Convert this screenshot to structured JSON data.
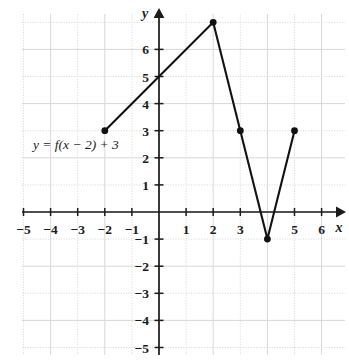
{
  "figure": {
    "kind": "cartesian-graph",
    "background_color": "#ffffff",
    "grid_color": "#d8d8d8",
    "axis_color": "#1b1b1b",
    "curve_color": "#111111"
  },
  "annotation": {
    "equation_label": "y = f(x − 2) + 3"
  },
  "axes": {
    "x_axis_name": "x",
    "y_axis_name": "y",
    "x_tick_labels": [
      "−5",
      "−4",
      "−3",
      "−2",
      "−1",
      "1",
      "2",
      "3",
      "5",
      "6"
    ],
    "x_tick_values": [
      -5,
      -4,
      -3,
      -2,
      -1,
      1,
      2,
      3,
      5,
      6
    ],
    "y_tick_labels": [
      "6",
      "5",
      "4",
      "3",
      "2",
      "1",
      "−1",
      "−2",
      "−3",
      "−4",
      "−5"
    ],
    "y_tick_values": [
      6,
      5,
      4,
      3,
      2,
      1,
      -1,
      -2,
      -3,
      -4,
      -5
    ]
  },
  "chart_data": {
    "type": "line",
    "title": "",
    "subtitle": "",
    "xlabel": "x",
    "ylabel": "y",
    "xlim": [
      -5.05,
      6.85
    ],
    "ylim": [
      -5.2,
      7.3
    ],
    "grid": true,
    "grid_step": 1,
    "legend": false,
    "legend_position": "none",
    "annotations": [
      {
        "text": "y = f(x − 2) + 3",
        "x": -3.7,
        "y": 2.55
      }
    ],
    "series": [
      {
        "name": "y = f(x - 2) + 3",
        "x": [
          -2,
          2,
          3,
          4,
          5
        ],
        "values": [
          3,
          7,
          3,
          -1,
          3
        ],
        "marker": "filled-circle",
        "marked_points": [
          {
            "x": -2,
            "y": 3
          },
          {
            "x": 2,
            "y": 7
          },
          {
            "x": 3,
            "y": 3
          },
          {
            "x": 4,
            "y": -1
          },
          {
            "x": 5,
            "y": 3
          }
        ]
      }
    ],
    "x_ticks": [
      -5,
      -4,
      -3,
      -2,
      -1,
      1,
      2,
      3,
      5,
      6
    ],
    "y_ticks": [
      6,
      5,
      4,
      3,
      2,
      1,
      -1,
      -2,
      -3,
      -4,
      -5
    ]
  }
}
